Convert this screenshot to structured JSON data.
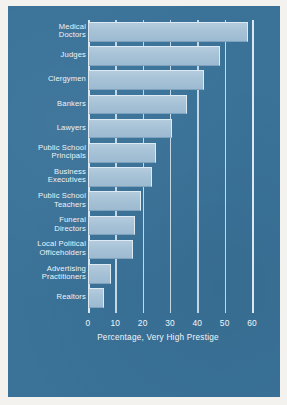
{
  "chart_data": {
    "type": "bar",
    "orientation": "horizontal",
    "title": "",
    "xlabel": "Percentage, Very High Prestige",
    "ylabel": "",
    "xlim": [
      0,
      60
    ],
    "xticks": [
      0,
      10,
      20,
      30,
      40,
      50,
      60
    ],
    "xtick_labels": [
      "0",
      "10",
      "20",
      "30",
      "40",
      "50",
      "60"
    ],
    "grid": true,
    "legend": false,
    "categories": [
      "Medical Doctors",
      "Judges",
      "Clergymen",
      "Bankers",
      "Lawyers",
      "Public School Principals",
      "Business Executives",
      "Public School Teachers",
      "Funeral Directors",
      "Local Political Officeholders",
      "Advertising Practitioners",
      "Realtors"
    ],
    "values": [
      58,
      48,
      42,
      36,
      30.5,
      24.5,
      23,
      19,
      17,
      16,
      8,
      5.5
    ]
  },
  "axis": {
    "title": "Percentage, Very High Prestige",
    "ticks": [
      {
        "value": 0,
        "label": "0"
      },
      {
        "value": 10,
        "label": "10"
      },
      {
        "value": 20,
        "label": "20"
      },
      {
        "value": 30,
        "label": "30"
      },
      {
        "value": 40,
        "label": "40"
      },
      {
        "value": 50,
        "label": "50"
      },
      {
        "value": 60,
        "label": "60"
      }
    ]
  },
  "bars": [
    {
      "label_lines": [
        "Medical",
        "Doctors"
      ],
      "value": 58
    },
    {
      "label_lines": [
        "Judges"
      ],
      "value": 48
    },
    {
      "label_lines": [
        "Clergymen"
      ],
      "value": 42
    },
    {
      "label_lines": [
        "Bankers"
      ],
      "value": 36
    },
    {
      "label_lines": [
        "Lawyers"
      ],
      "value": 30.5
    },
    {
      "label_lines": [
        "Public School",
        "Principals"
      ],
      "value": 24.5
    },
    {
      "label_lines": [
        "Business",
        "Executives"
      ],
      "value": 23
    },
    {
      "label_lines": [
        "Public School",
        "Teachers"
      ],
      "value": 19
    },
    {
      "label_lines": [
        "Funeral",
        "Directors"
      ],
      "value": 17
    },
    {
      "label_lines": [
        "Local Political",
        "Officeholders"
      ],
      "value": 16
    },
    {
      "label_lines": [
        "Advertising",
        "Practitioners"
      ],
      "value": 8
    },
    {
      "label_lines": [
        "Realtors"
      ],
      "value": 5.5
    }
  ],
  "colors": {
    "panel_background": "#3a7298",
    "bar_fill": "#a8c3d7",
    "bar_highlight": "#dceaf3",
    "bar_shadow": "#7ea2bd",
    "text": "#eef4f9",
    "grid": "#cfe0ec",
    "page_margin": "#f3f2ee"
  }
}
